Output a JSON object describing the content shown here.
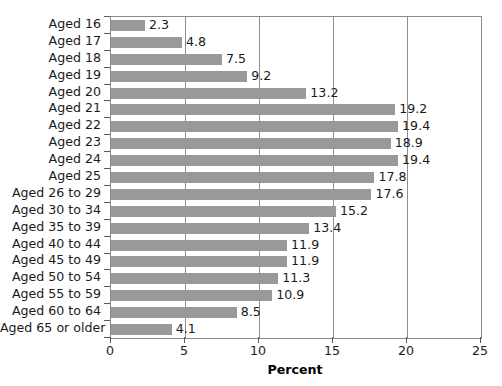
{
  "chart_data": {
    "type": "bar",
    "orientation": "horizontal",
    "title": "",
    "xlabel": "Percent",
    "ylabel": "",
    "xlim": [
      0,
      25
    ],
    "xticks": [
      0,
      5,
      10,
      15,
      20,
      25
    ],
    "xtick_labels": [
      "0",
      "5",
      "10",
      "15",
      "20",
      "25"
    ],
    "grid": "vertical",
    "legend": "none",
    "bar_color": "#999999",
    "categories": [
      "Aged 16",
      "Aged 17",
      "Aged 18",
      "Aged 19",
      "Aged 20",
      "Aged 21",
      "Aged 22",
      "Aged 23",
      "Aged 24",
      "Aged 25",
      "Aged 26 to 29",
      "Aged 30 to 34",
      "Aged 35 to 39",
      "Aged 40 to 44",
      "Aged 45 to 49",
      "Aged 50 to 54",
      "Aged 55 to 59",
      "Aged 60 to 64",
      "Aged 65 or older"
    ],
    "values": [
      2.3,
      4.8,
      7.5,
      9.2,
      13.2,
      19.2,
      19.4,
      18.9,
      19.4,
      17.8,
      17.6,
      15.2,
      13.4,
      11.9,
      11.9,
      11.3,
      10.9,
      8.5,
      4.1
    ],
    "value_labels": [
      "2.3",
      "4.8",
      "7.5",
      "9.2",
      "13.2",
      "19.2",
      "19.4",
      "18.9",
      "19.4",
      "17.8",
      "17.6",
      "15.2",
      "13.4",
      "11.9",
      "11.9",
      "11.3",
      "10.9",
      "8.5",
      "4.1"
    ]
  }
}
